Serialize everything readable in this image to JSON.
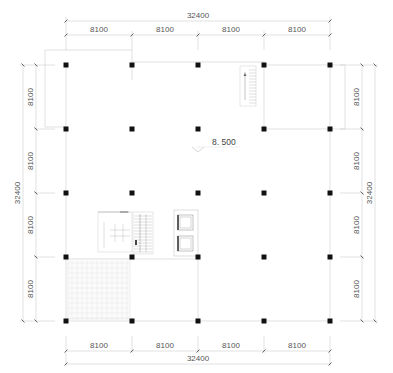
{
  "drawing": {
    "type": "structural floor plan",
    "elevation_label": "8. 500",
    "colors": {
      "column": "#111111",
      "wall_line": "#d8d8d8",
      "dim_line": "#cfcfcf",
      "dim_text": "#555555",
      "tile_grid": "#e6e6e6"
    }
  },
  "dimensions": {
    "top": {
      "total": "32400",
      "spans": [
        "8100",
        "8100",
        "8100",
        "8100"
      ]
    },
    "bottom": {
      "total": "32400",
      "spans": [
        "8100",
        "8100",
        "8100",
        "8100"
      ]
    },
    "left": {
      "total": "32400",
      "spans": [
        "8100",
        "8100",
        "8100",
        "8100"
      ]
    },
    "right": {
      "total": "32400",
      "spans": [
        "8100",
        "8100",
        "8100",
        "8100"
      ]
    }
  },
  "grid": {
    "x": [
      66,
      132,
      198,
      264,
      330
    ],
    "y": [
      65,
      129,
      193,
      257,
      321
    ]
  },
  "features": [
    {
      "name": "stair-north-east",
      "label": "stair"
    },
    {
      "name": "stair-core-west",
      "label": "stair"
    },
    {
      "name": "elevator-1",
      "label": "elevator"
    },
    {
      "name": "elevator-2",
      "label": "elevator"
    },
    {
      "name": "tiled-area-south-west",
      "label": "tiled floor"
    }
  ]
}
